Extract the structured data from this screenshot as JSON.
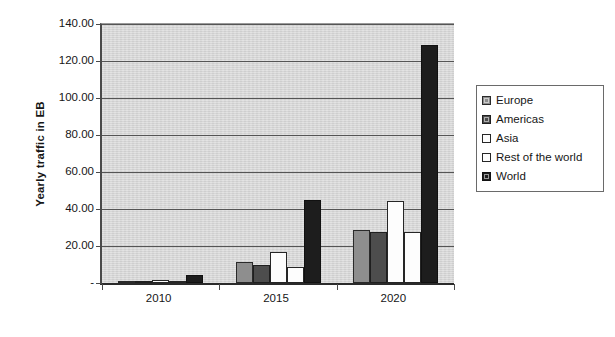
{
  "chart_data": {
    "type": "bar",
    "title": "",
    "xlabel": "",
    "ylabel": "Yearly traffic in EB",
    "categories": [
      "2010",
      "2015",
      "2020"
    ],
    "ylim": [
      0,
      140
    ],
    "ytick_values": [
      140,
      120,
      100,
      80,
      60,
      40,
      20,
      0
    ],
    "ytick_labels": [
      "140.00",
      "120.00",
      "100.00",
      "80.00",
      "60.00",
      "40.00",
      "20.00",
      "-"
    ],
    "grid": true,
    "legend_position": "right",
    "series": [
      {
        "name": "Europe",
        "color": "#8e8e8e",
        "values": [
          1.0,
          11.5,
          28.5
        ]
      },
      {
        "name": "Americas",
        "color": "#4d4d4d",
        "values": [
          1.2,
          10.0,
          27.5
        ]
      },
      {
        "name": "Asia",
        "color": "#ffffff",
        "values": [
          1.5,
          16.5,
          44.5
        ]
      },
      {
        "name": "Rest of the world",
        "color": "#ffffff",
        "values": [
          0.8,
          8.5,
          27.5
        ]
      },
      {
        "name": "World",
        "color": "#1d1d1d",
        "values": [
          4.2,
          45.0,
          128.5
        ]
      }
    ]
  },
  "legend": {
    "items": [
      {
        "label": "Europe"
      },
      {
        "label": "Americas"
      },
      {
        "label": "Asia"
      },
      {
        "label": "Rest of the world"
      },
      {
        "label": "World"
      }
    ]
  }
}
